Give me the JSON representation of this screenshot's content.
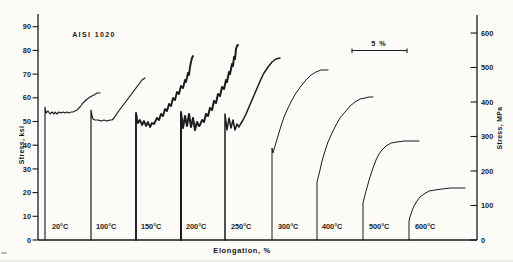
{
  "figure": {
    "title": "AISI 1020",
    "xlabel": "Elongation, %",
    "ylabel_left": "Stress, ksi",
    "ylabel_right": "Stress, MPa",
    "scale_bar_label": "5 %",
    "ink_color": "#1b1b1b",
    "paper_color": "#fcfbf8"
  },
  "chart_data": {
    "type": "line",
    "title": "AISI 1020",
    "xlabel": "Elongation, %",
    "x_axis": {
      "label": "Elongation, %",
      "numeric_ticks_shown": false,
      "scale_bar": {
        "label": "5 %",
        "span_percent": 5
      }
    },
    "left_axis": {
      "label": "Stress, ksi",
      "unit": "ksi",
      "min": 0,
      "max": 90,
      "tick_step": 10
    },
    "right_axis": {
      "label": "Stress, MPa",
      "unit": "MPa",
      "min": 0,
      "max": 600,
      "tick_step": 100
    },
    "grid": false,
    "legend": "temperature labels along baseline",
    "series": [
      {
        "label": "20°C",
        "temperature_c": 20,
        "serrated_flow": true,
        "approx_yield_ksi": 54,
        "approx_max_ksi": 62,
        "approx_max_mpa": 427,
        "line_weight": 1.1,
        "label_x": 52,
        "path_px": [
          [
            45,
            240
          ],
          [
            45,
            107
          ],
          [
            46,
            113
          ],
          [
            48,
            111
          ],
          [
            50,
            114
          ],
          [
            52,
            112
          ],
          [
            54,
            114
          ],
          [
            55,
            112
          ],
          [
            57,
            114
          ],
          [
            59,
            112
          ],
          [
            61,
            113
          ],
          [
            63,
            112
          ],
          [
            65,
            113
          ],
          [
            67,
            112
          ],
          [
            69,
            113
          ],
          [
            71,
            112
          ],
          [
            73,
            112
          ],
          [
            75,
            111
          ],
          [
            77,
            110
          ],
          [
            80,
            107
          ],
          [
            83,
            103
          ],
          [
            86,
            100
          ],
          [
            90,
            97
          ],
          [
            94,
            95
          ],
          [
            97,
            93
          ],
          [
            100,
            93
          ]
        ]
      },
      {
        "label": "100°C",
        "temperature_c": 100,
        "serrated_flow": false,
        "approx_yield_ksi": 51,
        "approx_max_ksi": 68,
        "approx_max_mpa": 469,
        "line_weight": 1.2,
        "label_x": 96,
        "path_px": [
          [
            91,
            240
          ],
          [
            91,
            110
          ],
          [
            92,
            116
          ],
          [
            93,
            119
          ],
          [
            95,
            120
          ],
          [
            98,
            120
          ],
          [
            101,
            121
          ],
          [
            104,
            120
          ],
          [
            107,
            121
          ],
          [
            110,
            120
          ],
          [
            112,
            120
          ],
          [
            114,
            118
          ],
          [
            116,
            115
          ],
          [
            118,
            112
          ],
          [
            121,
            108
          ],
          [
            124,
            104
          ],
          [
            127,
            100
          ],
          [
            130,
            96
          ],
          [
            133,
            92
          ],
          [
            136,
            88
          ],
          [
            139,
            84
          ],
          [
            142,
            80
          ],
          [
            145,
            78
          ]
        ]
      },
      {
        "label": "150°C",
        "temperature_c": 150,
        "serrated_flow": true,
        "approx_yield_ksi": 50,
        "approx_max_ksi": 78,
        "approx_max_mpa": 538,
        "line_weight": 1.9,
        "label_x": 141,
        "path_px": [
          [
            136,
            240
          ],
          [
            136,
            113
          ],
          [
            137,
            119
          ],
          [
            138,
            123
          ],
          [
            140,
            120
          ],
          [
            142,
            125
          ],
          [
            144,
            121
          ],
          [
            146,
            126
          ],
          [
            148,
            122
          ],
          [
            150,
            127
          ],
          [
            152,
            123
          ],
          [
            154,
            124
          ],
          [
            155,
            122
          ],
          [
            157,
            118
          ],
          [
            159,
            120
          ],
          [
            161,
            114
          ],
          [
            163,
            116
          ],
          [
            165,
            109
          ],
          [
            167,
            111
          ],
          [
            169,
            104
          ],
          [
            171,
            106
          ],
          [
            173,
            98
          ],
          [
            175,
            100
          ],
          [
            177,
            92
          ],
          [
            179,
            94
          ],
          [
            181,
            86
          ],
          [
            183,
            88
          ],
          [
            185,
            80
          ],
          [
            186,
            82
          ],
          [
            188,
            73
          ],
          [
            189,
            75
          ],
          [
            190,
            67
          ],
          [
            191,
            62
          ],
          [
            192,
            58
          ],
          [
            193,
            56
          ]
        ]
      },
      {
        "label": "200°C",
        "temperature_c": 200,
        "serrated_flow": true,
        "approx_yield_ksi": 50,
        "approx_max_ksi": 82,
        "approx_max_mpa": 565,
        "line_weight": 2.0,
        "label_x": 186,
        "path_px": [
          [
            181,
            240
          ],
          [
            181,
            112
          ],
          [
            182,
            120
          ],
          [
            183,
            128
          ],
          [
            185,
            116
          ],
          [
            187,
            126
          ],
          [
            189,
            114
          ],
          [
            191,
            127
          ],
          [
            193,
            118
          ],
          [
            195,
            130
          ],
          [
            197,
            122
          ],
          [
            199,
            126
          ],
          [
            200,
            125
          ],
          [
            202,
            120
          ],
          [
            204,
            122
          ],
          [
            206,
            114
          ],
          [
            208,
            116
          ],
          [
            210,
            108
          ],
          [
            212,
            110
          ],
          [
            214,
            101
          ],
          [
            216,
            103
          ],
          [
            218,
            94
          ],
          [
            220,
            96
          ],
          [
            222,
            87
          ],
          [
            224,
            89
          ],
          [
            226,
            80
          ],
          [
            227,
            82
          ],
          [
            229,
            72
          ],
          [
            230,
            74
          ],
          [
            232,
            64
          ],
          [
            233,
            66
          ],
          [
            234,
            57
          ],
          [
            235,
            59
          ],
          [
            236,
            49
          ],
          [
            237,
            46
          ],
          [
            238,
            45
          ]
        ]
      },
      {
        "label": "250°C",
        "temperature_c": 250,
        "serrated_flow": true,
        "approx_yield_ksi": 49,
        "approx_max_ksi": 77,
        "approx_max_mpa": 531,
        "line_weight": 1.5,
        "label_x": 231,
        "path_px": [
          [
            225,
            240
          ],
          [
            225,
            114
          ],
          [
            226,
            122
          ],
          [
            227,
            130
          ],
          [
            229,
            118
          ],
          [
            231,
            128
          ],
          [
            233,
            120
          ],
          [
            235,
            130
          ],
          [
            237,
            124
          ],
          [
            239,
            127
          ],
          [
            240,
            125
          ],
          [
            243,
            120
          ],
          [
            246,
            114
          ],
          [
            249,
            107
          ],
          [
            252,
            100
          ],
          [
            255,
            93
          ],
          [
            258,
            86
          ],
          [
            261,
            79
          ],
          [
            264,
            73
          ],
          [
            268,
            67
          ],
          [
            272,
            62
          ],
          [
            276,
            59
          ],
          [
            280,
            58
          ]
        ]
      },
      {
        "label": "300°C",
        "temperature_c": 300,
        "serrated_flow": false,
        "approx_yield_ksi": 38,
        "approx_max_ksi": 71,
        "approx_max_mpa": 490,
        "line_weight": 1.0,
        "label_x": 278,
        "path_px": [
          [
            272,
            240
          ],
          [
            272,
            152
          ],
          [
            272,
            148
          ],
          [
            273,
            153
          ],
          [
            275,
            146
          ],
          [
            278,
            136
          ],
          [
            281,
            126
          ],
          [
            284,
            117
          ],
          [
            288,
            108
          ],
          [
            292,
            100
          ],
          [
            296,
            93
          ],
          [
            301,
            86
          ],
          [
            306,
            80
          ],
          [
            311,
            75
          ],
          [
            316,
            72
          ],
          [
            321,
            70
          ],
          [
            325,
            70
          ],
          [
            328,
            70
          ]
        ]
      },
      {
        "label": "400°C",
        "temperature_c": 400,
        "serrated_flow": false,
        "approx_yield_ksi": 25,
        "approx_max_ksi": 61,
        "approx_max_mpa": 421,
        "line_weight": 1.0,
        "label_x": 322,
        "path_px": [
          [
            317,
            240
          ],
          [
            317,
            182
          ],
          [
            318,
            178
          ],
          [
            320,
            170
          ],
          [
            322,
            161
          ],
          [
            325,
            151
          ],
          [
            328,
            142
          ],
          [
            332,
            133
          ],
          [
            336,
            125
          ],
          [
            340,
            118
          ],
          [
            345,
            112
          ],
          [
            350,
            106
          ],
          [
            355,
            102
          ],
          [
            360,
            99
          ],
          [
            365,
            98
          ],
          [
            369,
            97
          ],
          [
            373,
            97
          ]
        ]
      },
      {
        "label": "500°C",
        "temperature_c": 500,
        "serrated_flow": false,
        "approx_yield_ksi": 16,
        "approx_max_ksi": 42,
        "approx_max_mpa": 290,
        "line_weight": 1.0,
        "label_x": 369,
        "path_px": [
          [
            363,
            240
          ],
          [
            363,
            203
          ],
          [
            364,
            199
          ],
          [
            366,
            191
          ],
          [
            368,
            184
          ],
          [
            370,
            177
          ],
          [
            373,
            168
          ],
          [
            376,
            160
          ],
          [
            379,
            154
          ],
          [
            382,
            150
          ],
          [
            386,
            146
          ],
          [
            391,
            143
          ],
          [
            397,
            142
          ],
          [
            404,
            141
          ],
          [
            411,
            141
          ],
          [
            419,
            141
          ]
        ]
      },
      {
        "label": "600°C",
        "temperature_c": 600,
        "serrated_flow": false,
        "approx_yield_ksi": 9,
        "approx_max_ksi": 23,
        "approx_max_mpa": 159,
        "line_weight": 1.0,
        "label_x": 415,
        "path_px": [
          [
            409,
            240
          ],
          [
            409,
            221
          ],
          [
            410,
            217
          ],
          [
            412,
            211
          ],
          [
            414,
            206
          ],
          [
            417,
            201
          ],
          [
            420,
            197
          ],
          [
            424,
            194
          ],
          [
            429,
            191
          ],
          [
            435,
            190
          ],
          [
            442,
            189
          ],
          [
            450,
            188
          ],
          [
            458,
            188
          ],
          [
            465,
            188
          ]
        ]
      }
    ]
  }
}
